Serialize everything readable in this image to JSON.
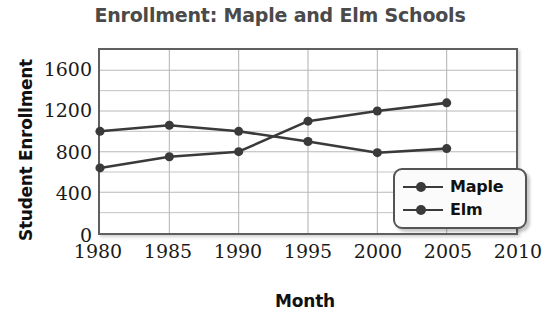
{
  "chart_data": {
    "type": "line",
    "title": "Enrollment: Maple and Elm Schools",
    "xlabel": "Month",
    "ylabel": "Student Enrollment",
    "x": [
      1980,
      1985,
      1990,
      1995,
      2000,
      2005
    ],
    "xticks": [
      "1980",
      "1985",
      "1990",
      "1995",
      "2000",
      "2005",
      "2010"
    ],
    "xtick_values": [
      1980,
      1985,
      1990,
      1995,
      2000,
      2005,
      2010
    ],
    "yticks": [
      "0",
      "400",
      "800",
      "1200",
      "1600"
    ],
    "ytick_values": [
      0,
      400,
      800,
      1200,
      1600
    ],
    "xlim": [
      1980,
      2010
    ],
    "ylim": [
      0,
      1800
    ],
    "grid": true,
    "minor_grid_step": 200,
    "legend_position": "bottom-right",
    "series": [
      {
        "name": "Maple",
        "values": [
          640,
          750,
          800,
          1100,
          1200,
          1280
        ],
        "color": "#3a3a3a",
        "marker": "circle"
      },
      {
        "name": "Elm",
        "values": [
          1000,
          1060,
          1000,
          900,
          790,
          830
        ],
        "color": "#3a3a3a",
        "marker": "circle"
      }
    ]
  },
  "colors": {
    "line": "#3a3a3a",
    "grid": "#b8b8b8",
    "axis": "#5f5f5f",
    "title_text": "#4a4a4a",
    "tick_text": "#1a1a1a",
    "background": "#ffffff"
  }
}
